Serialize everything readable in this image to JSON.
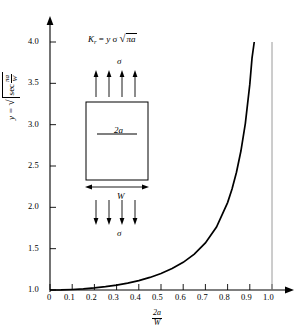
{
  "figure": {
    "title": "",
    "equation": {
      "lhs": "K",
      "lhs_sub": "r",
      "eq": "=",
      "rhs_y": "y",
      "rhs_sigma": "σ",
      "sqrt_symbol": "√",
      "radicand": "πa",
      "full": "K_r = y σ √(πa)"
    },
    "inset": {
      "name": "center-cracked-plate",
      "crack_label": "2a",
      "width_label": "W",
      "stress_top_label": "σ",
      "stress_bottom_label": "σ",
      "arrow_count_top": 4,
      "arrow_count_bottom": 4
    },
    "yaxis_label": {
      "var": "y",
      "eq": "=",
      "sqrt_symbol": "√",
      "sec": "sec",
      "frac_num": "πa",
      "frac_den": "W",
      "full": "y = √(sec(πa/W))"
    },
    "xaxis_label": {
      "num": "2a",
      "den": "W",
      "full": "2a/W"
    }
  },
  "chart_data": {
    "type": "line",
    "title": "",
    "xlabel": "2a/W",
    "ylabel": "y = sqrt(sec(pi*a/W))",
    "xlim": [
      0,
      1.0
    ],
    "ylim": [
      1.0,
      4.0
    ],
    "grid": false,
    "legend": null,
    "xticks": [
      0,
      0.1,
      0.2,
      0.3,
      0.4,
      0.5,
      0.6,
      0.7,
      0.8,
      0.9,
      1.0
    ],
    "xtick_labels": [
      "0",
      "0.1",
      "0.2",
      "0.3",
      "0.4",
      "0.5",
      "0.6",
      "0.7",
      "0.8",
      "0.9",
      "1.0"
    ],
    "yticks": [
      1.0,
      1.5,
      2.0,
      2.5,
      3.0,
      3.5,
      4.0
    ],
    "ytick_labels": [
      "1.0",
      "1.5",
      "2.0",
      "2.5",
      "3.0",
      "3.5",
      "4.0"
    ],
    "series": [
      {
        "name": "y = sqrt(sec(pi*x/2))",
        "x": [
          0,
          0.05,
          0.1,
          0.15,
          0.2,
          0.25,
          0.3,
          0.35,
          0.4,
          0.45,
          0.5,
          0.55,
          0.6,
          0.65,
          0.7,
          0.75,
          0.8,
          0.82,
          0.84,
          0.86,
          0.88,
          0.9,
          0.91,
          0.92,
          0.93,
          0.94,
          0.945,
          0.95,
          0.9525
        ],
        "values": [
          1.0,
          1.001,
          1.006,
          1.014,
          1.025,
          1.04,
          1.059,
          1.084,
          1.114,
          1.152,
          1.199,
          1.259,
          1.335,
          1.434,
          1.569,
          1.761,
          2.057,
          2.222,
          2.425,
          2.681,
          3.017,
          3.487,
          3.804,
          4.204,
          4.742,
          5.519,
          6.062,
          6.806,
          7.3
        ]
      },
      {
        "name": "asymptote",
        "x": [
          1.0,
          1.0
        ],
        "values": [
          1.0,
          4.0
        ]
      }
    ],
    "annotations": [
      {
        "text": "K_r = y σ √(πa)",
        "x": 0.3,
        "y": 3.85
      },
      {
        "text": "2a",
        "x": 0.3,
        "y": 2.95
      },
      {
        "text": "W",
        "x": 0.3,
        "y": 2.18
      },
      {
        "text": "σ",
        "x": 0.3,
        "y": 3.55
      },
      {
        "text": "σ",
        "x": 0.3,
        "y": 1.7
      }
    ],
    "curve_endpoint": {
      "x": 0.9525,
      "y": 4.0
    },
    "asymptote_x": 1.0
  }
}
